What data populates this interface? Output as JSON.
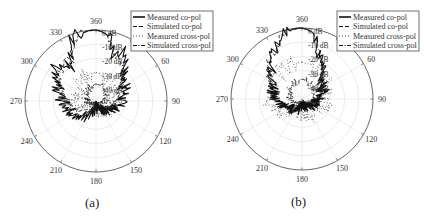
{
  "figure": {
    "panels": [
      {
        "id": "a",
        "caption": "(a)"
      },
      {
        "id": "b",
        "caption": "(b)"
      }
    ]
  },
  "chart_data": [
    {
      "type": "polar",
      "title": "(a)",
      "angle_ticks": [
        "360",
        "30",
        "60",
        "90",
        "120",
        "150",
        "180",
        "210",
        "240",
        "270",
        "300",
        "330"
      ],
      "angle_tick_values_deg": [
        0,
        30,
        60,
        90,
        120,
        150,
        180,
        210,
        240,
        270,
        300,
        330
      ],
      "radial_ticks": [
        "0 dB",
        "-10 dB",
        "-20 dB",
        "-30 dB",
        "-40 dB"
      ],
      "radial_range_db": [
        -50,
        0
      ],
      "legend": [
        "Measured co-pol",
        "Simulated co-pol",
        "Measured cross-pol",
        "Simulated cross-pol"
      ],
      "legend_position": "upper right",
      "grid": true,
      "series": [
        {
          "name": "Measured co-pol",
          "style": "solid",
          "angles_deg": [
            0,
            5,
            10,
            15,
            20,
            25,
            30,
            35,
            40,
            45,
            50,
            55,
            60,
            70,
            80,
            90,
            100,
            110,
            120,
            130,
            140,
            150,
            160,
            170,
            180,
            190,
            200,
            210,
            220,
            230,
            240,
            250,
            260,
            270,
            280,
            290,
            300,
            305,
            310,
            315,
            320,
            325,
            330,
            335,
            340,
            345,
            350,
            355
          ],
          "values_db": [
            0,
            -1,
            -3,
            -8,
            -16,
            -12,
            -10,
            -12,
            -18,
            -22,
            -24,
            -26,
            -28,
            -28,
            -30,
            -32,
            -34,
            -36,
            -38,
            -42,
            -40,
            -44,
            -42,
            -46,
            -45,
            -44,
            -40,
            -38,
            -36,
            -34,
            -32,
            -30,
            -28,
            -26,
            -24,
            -22,
            -18,
            -14,
            -12,
            -13,
            -18,
            -20,
            -14,
            -6,
            -3,
            -2,
            -1,
            0
          ]
        },
        {
          "name": "Simulated co-pol",
          "style": "dashed",
          "angles_deg": [
            0,
            10,
            20,
            30,
            40,
            60,
            90,
            120,
            150,
            180,
            210,
            240,
            270,
            300,
            320,
            330,
            340,
            350
          ],
          "values_db": [
            0,
            -3,
            -15,
            -14,
            -22,
            -30,
            -35,
            -40,
            -44,
            -45,
            -42,
            -36,
            -30,
            -20,
            -14,
            -16,
            -5,
            -1
          ]
        },
        {
          "name": "Measured cross-pol",
          "style": "dotted",
          "angles_deg": [
            0,
            30,
            60,
            90,
            120,
            150,
            180,
            210,
            240,
            270,
            300,
            330
          ],
          "values_db": [
            -30,
            -32,
            -36,
            -38,
            -40,
            -42,
            -44,
            -42,
            -40,
            -38,
            -36,
            -32
          ]
        },
        {
          "name": "Simulated cross-pol",
          "style": "dashdot",
          "angles_deg": [
            0,
            30,
            60,
            90,
            120,
            150,
            180,
            210,
            240,
            270,
            300,
            330
          ],
          "values_db": [
            -38,
            -40,
            -42,
            -44,
            -46,
            -47,
            -48,
            -47,
            -46,
            -44,
            -42,
            -40
          ]
        }
      ]
    },
    {
      "type": "polar",
      "title": "(b)",
      "angle_ticks": [
        "360",
        "30",
        "60",
        "90",
        "120",
        "150",
        "180",
        "210",
        "240",
        "270",
        "300",
        "330"
      ],
      "angle_tick_values_deg": [
        0,
        30,
        60,
        90,
        120,
        150,
        180,
        210,
        240,
        270,
        300,
        330
      ],
      "radial_ticks": [
        "0 dB",
        "-10 dB",
        "-20 dB",
        "-30 dB",
        "-40 dB"
      ],
      "radial_range_db": [
        -50,
        0
      ],
      "legend": [
        "Measured co-pol",
        "Simulated co-pol",
        "Measured cross-pol",
        "Simulated cross-pol"
      ],
      "legend_position": "upper right",
      "grid": true,
      "series": [
        {
          "name": "Measured co-pol",
          "style": "solid",
          "angles_deg": [
            0,
            5,
            10,
            15,
            20,
            25,
            30,
            35,
            40,
            45,
            50,
            60,
            70,
            80,
            90,
            100,
            110,
            120,
            130,
            140,
            150,
            160,
            170,
            180,
            190,
            200,
            210,
            220,
            230,
            240,
            250,
            260,
            270,
            280,
            290,
            300,
            310,
            315,
            320,
            325,
            330,
            335,
            340,
            345,
            350,
            355
          ],
          "values_db": [
            0,
            -1,
            -3,
            -10,
            -16,
            -17,
            -20,
            -24,
            -28,
            -30,
            -32,
            -34,
            -34,
            -36,
            -38,
            -40,
            -40,
            -42,
            -42,
            -44,
            -44,
            -44,
            -46,
            -45,
            -44,
            -42,
            -42,
            -40,
            -40,
            -38,
            -36,
            -34,
            -32,
            -30,
            -28,
            -26,
            -22,
            -20,
            -18,
            -14,
            -10,
            -8,
            -4,
            -2,
            -1,
            0
          ]
        },
        {
          "name": "Simulated co-pol",
          "style": "dashed",
          "angles_deg": [
            0,
            10,
            20,
            30,
            40,
            60,
            90,
            120,
            150,
            180,
            210,
            240,
            270,
            300,
            330,
            345
          ],
          "values_db": [
            0,
            -3,
            -16,
            -20,
            -28,
            -34,
            -38,
            -42,
            -44,
            -45,
            -42,
            -38,
            -32,
            -24,
            -10,
            -2
          ]
        },
        {
          "name": "Measured cross-pol",
          "style": "dotted",
          "angles_deg": [
            0,
            30,
            60,
            90,
            120,
            150,
            180,
            210,
            240,
            270,
            300,
            330
          ],
          "values_db": [
            -24,
            -28,
            -32,
            -34,
            -36,
            -38,
            -40,
            -38,
            -30,
            -28,
            -28,
            -26
          ]
        },
        {
          "name": "Simulated cross-pol",
          "style": "dashdot",
          "angles_deg": [
            0,
            30,
            60,
            90,
            120,
            150,
            180,
            210,
            240,
            270,
            300,
            330
          ],
          "values_db": [
            -36,
            -38,
            -40,
            -42,
            -44,
            -46,
            -48,
            -46,
            -44,
            -42,
            -40,
            -38
          ]
        }
      ]
    }
  ]
}
